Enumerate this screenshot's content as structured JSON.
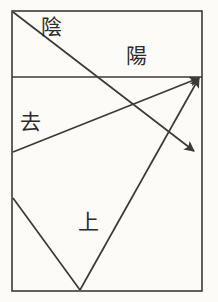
{
  "diagram": {
    "canvas": {
      "width": 218,
      "height": 302
    },
    "colors": {
      "background": "#fcfbf8",
      "stroke": "#3a3a38",
      "text": "#2b2b2b"
    },
    "frame": {
      "name": "outer-rectangle",
      "x": 12,
      "y": 11,
      "width": 190,
      "height": 280,
      "stroke_width": 1.6
    },
    "divider": {
      "name": "horizontal-divider",
      "x1": 12,
      "y1": 77,
      "x2": 202,
      "y2": 77,
      "stroke_width": 1.3
    },
    "labels": [
      {
        "id": "yin",
        "text": "陰",
        "x": 41,
        "y": 17,
        "font_size": 21
      },
      {
        "id": "yang",
        "text": "陽",
        "x": 126,
        "y": 46,
        "font_size": 21
      },
      {
        "id": "qu",
        "text": "去",
        "x": 20,
        "y": 112,
        "font_size": 21
      },
      {
        "id": "shang",
        "text": "上",
        "x": 78,
        "y": 212,
        "font_size": 21
      }
    ],
    "vectors": [
      {
        "id": "yin-descending-arrow",
        "label": "陰",
        "from": {
          "x": 13,
          "y": 12
        },
        "to": {
          "x": 194,
          "y": 151
        },
        "arrowhead": "end",
        "stroke_width": 1.7
      },
      {
        "id": "qu-ascending-arrow",
        "label": "去",
        "from": {
          "x": 13,
          "y": 152
        },
        "to": {
          "x": 199,
          "y": 78
        },
        "arrowhead": "end",
        "stroke_width": 1.7
      },
      {
        "id": "shang-ascending-arrow",
        "label": "上",
        "from": {
          "x": 80,
          "y": 290
        },
        "to": {
          "x": 199,
          "y": 78
        },
        "arrowhead": "end",
        "stroke_width": 1.7
      },
      {
        "id": "left-descending-segment",
        "label": "",
        "from": {
          "x": 13,
          "y": 198
        },
        "to": {
          "x": 80,
          "y": 290
        },
        "arrowhead": "none",
        "stroke_width": 1.7
      }
    ]
  }
}
